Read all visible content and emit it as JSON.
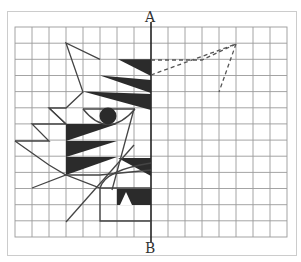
{
  "figure": {
    "axis_top_label": "A",
    "axis_bottom_label": "B",
    "grid": {
      "columns": 16,
      "rows": 13,
      "origin_px": [
        15,
        27
      ],
      "cell_w": 17,
      "cell_h": 16.15,
      "line_color": "#9a9a9a"
    },
    "axis_of_symmetry": {
      "x_px": 151,
      "color": "#222222"
    },
    "colors": {
      "frame": "#cccccc",
      "stroke": "#444444",
      "fill": "#2b2b2b",
      "dashed": "#555555"
    }
  }
}
